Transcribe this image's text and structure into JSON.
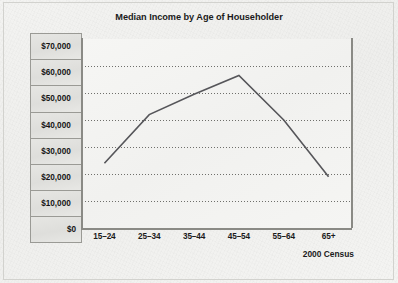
{
  "chart_data": {
    "type": "line",
    "title": "Median Income by Age of Householder",
    "xlabel": "",
    "ylabel": "",
    "categories": [
      "15–24",
      "25–34",
      "35–44",
      "45–54",
      "55–64",
      "65+"
    ],
    "values": [
      24000,
      42000,
      49500,
      56500,
      40000,
      19000
    ],
    "series": [
      {
        "name": "Median Income",
        "values": [
          24000,
          42000,
          49500,
          56500,
          40000,
          19000
        ]
      }
    ],
    "ylim": [
      0,
      70000
    ],
    "ytick_values": [
      70000,
      60000,
      50000,
      40000,
      30000,
      20000,
      10000,
      0
    ],
    "ytick_labels": [
      "$70,000",
      "$60,000",
      "$50,000",
      "$40,000",
      "$30,000",
      "$20,000",
      "$10,000",
      "$0"
    ],
    "grid": "horizontal-dotted",
    "legend": "none",
    "annotation": "2000 Census",
    "line_color": "#56565a",
    "grid_color": "#6f6f6b",
    "axis_color": "#8a8a85",
    "plot_bg_color": "#f3f3f1",
    "label_box_color": "#e2e2df"
  },
  "source_note": "2000 Census"
}
